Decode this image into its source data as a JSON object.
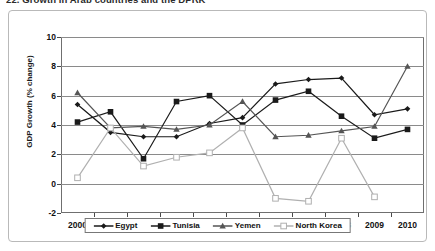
{
  "figure": {
    "title": "22.  Growth in Arab countries and the DPRK"
  },
  "axes": {
    "ylabel": "GDP Growth (% change)",
    "xlabel": "",
    "yticks": [
      -2,
      0,
      2,
      4,
      6,
      8,
      10
    ],
    "ytick_labels": [
      "-2",
      "0",
      "2",
      "4",
      "6",
      "8",
      "10"
    ],
    "xtick_labels": [
      "2000",
      "2001",
      "2002",
      "2003",
      "2004",
      "2005",
      "2006",
      "2007",
      "2008",
      "2009",
      "2010"
    ]
  },
  "legend": {
    "position": "bottom-center",
    "items": [
      {
        "label": "Egypt",
        "marker": "diamond",
        "color": "#1a1a1a"
      },
      {
        "label": "Tunisia",
        "marker": "square",
        "color": "#1a1a1a"
      },
      {
        "label": "Yemen",
        "marker": "triangle",
        "color": "#555555"
      },
      {
        "label": "North Korea",
        "marker": "open-square",
        "color": "#b0b0b0"
      }
    ]
  },
  "chart_data": {
    "type": "line",
    "title": "22.  Growth in Arab countries and the DPRK",
    "xlabel": "",
    "ylabel": "GDP Growth (% change)",
    "x": [
      2000,
      2001,
      2002,
      2003,
      2004,
      2005,
      2006,
      2007,
      2008,
      2009,
      2010
    ],
    "categories": [
      "2000",
      "2001",
      "2002",
      "2003",
      "2004",
      "2005",
      "2006",
      "2007",
      "2008",
      "2009",
      "2010"
    ],
    "ylim": [
      -2,
      10
    ],
    "ytick_step": 2,
    "grid": "horizontal",
    "legend_position": "bottom-center",
    "series": [
      {
        "name": "Egypt",
        "marker": "diamond",
        "color": "#1a1a1a",
        "values": [
          5.4,
          3.5,
          3.2,
          3.2,
          4.1,
          4.5,
          6.8,
          7.1,
          7.2,
          4.7,
          5.1
        ]
      },
      {
        "name": "Tunisia",
        "marker": "square",
        "color": "#1a1a1a",
        "values": [
          4.2,
          4.9,
          1.7,
          5.6,
          6.0,
          4.0,
          5.7,
          6.3,
          4.6,
          3.1,
          3.7
        ]
      },
      {
        "name": "Yemen",
        "marker": "triangle",
        "color": "#555555",
        "values": [
          6.2,
          3.8,
          3.9,
          3.7,
          4.0,
          5.6,
          3.2,
          3.3,
          3.6,
          3.9,
          8.0
        ]
      },
      {
        "name": "North Korea",
        "marker": "open-square",
        "color": "#b0b0b0",
        "values": [
          0.4,
          3.8,
          1.2,
          1.8,
          2.1,
          3.8,
          -1.0,
          -1.2,
          3.1,
          -0.9,
          null
        ]
      }
    ]
  }
}
